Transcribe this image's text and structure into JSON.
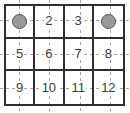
{
  "board": {
    "rows": 3,
    "cols": 4,
    "cells": [
      {
        "type": "counter",
        "label": "",
        "icon": "counter-circle-icon"
      },
      {
        "type": "number",
        "label": "2"
      },
      {
        "type": "number",
        "label": "3"
      },
      {
        "type": "counter",
        "label": "",
        "icon": "counter-circle-icon"
      },
      {
        "type": "number",
        "label": "5"
      },
      {
        "type": "number",
        "label": "6"
      },
      {
        "type": "number",
        "label": "7"
      },
      {
        "type": "number",
        "label": "8"
      },
      {
        "type": "number",
        "label": "9"
      },
      {
        "type": "number",
        "label": "10"
      },
      {
        "type": "number",
        "label": "11"
      },
      {
        "type": "number",
        "label": "12"
      }
    ],
    "colors": {
      "grid_line": "#303030",
      "dashed_line": "#a6a6a6",
      "number_text": "#3c3c3c",
      "counter_fill": "#999999",
      "counter_border": "#4f4f4f",
      "background": "#ffffff"
    }
  }
}
